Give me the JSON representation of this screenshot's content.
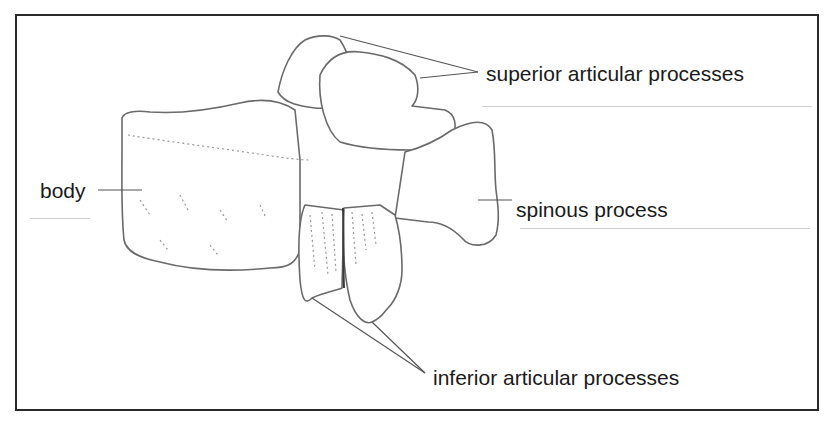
{
  "diagram": {
    "labels": {
      "superior": "superior articular processes",
      "body": "body",
      "spinous": "spinous process",
      "inferior": "inferior articular processes"
    },
    "colors": {
      "border": "#2a2a2a",
      "text": "#1a1a1a",
      "line": "#555555"
    }
  }
}
